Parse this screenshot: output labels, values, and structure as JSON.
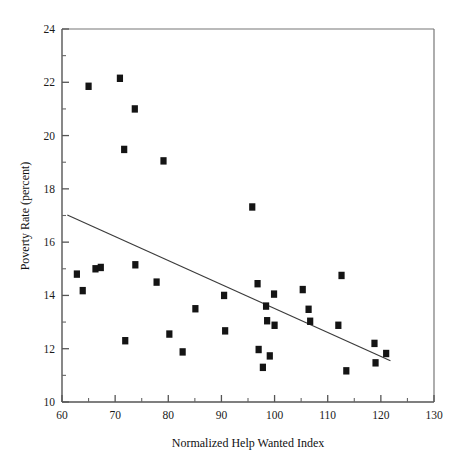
{
  "chart_data": {
    "type": "scatter",
    "title": "",
    "xlabel": "Normalized Help Wanted Index",
    "ylabel": "Poverty Rate (percent)",
    "xlim": [
      60,
      130
    ],
    "ylim": [
      10,
      24
    ],
    "x_major_ticks": [
      60,
      70,
      80,
      90,
      100,
      110,
      120,
      130
    ],
    "x_minor_ticks": [
      65,
      75,
      85,
      95,
      105,
      115,
      125
    ],
    "y_major_ticks": [
      10,
      12,
      14,
      16,
      18,
      20,
      22,
      24
    ],
    "y_minor_ticks": [
      11,
      13,
      15,
      17,
      19,
      21,
      23
    ],
    "x_tick_labels": [
      "60",
      "70",
      "80",
      "90",
      "100",
      "110",
      "120",
      "130"
    ],
    "y_tick_labels": [
      "10",
      "12",
      "14",
      "16",
      "18",
      "20",
      "22",
      "24"
    ],
    "grid": false,
    "legend": "none",
    "marker_shape": "square",
    "marker_color": "#141414",
    "points": [
      {
        "x": 62.8,
        "y": 14.8
      },
      {
        "x": 63.9,
        "y": 14.18
      },
      {
        "x": 65.0,
        "y": 21.85
      },
      {
        "x": 66.3,
        "y": 15.0
      },
      {
        "x": 67.3,
        "y": 15.05
      },
      {
        "x": 70.9,
        "y": 22.15
      },
      {
        "x": 71.7,
        "y": 19.48
      },
      {
        "x": 71.9,
        "y": 12.3
      },
      {
        "x": 73.7,
        "y": 21.0
      },
      {
        "x": 73.8,
        "y": 15.15
      },
      {
        "x": 77.8,
        "y": 14.5
      },
      {
        "x": 79.1,
        "y": 19.05
      },
      {
        "x": 80.2,
        "y": 12.55
      },
      {
        "x": 82.7,
        "y": 11.88
      },
      {
        "x": 85.1,
        "y": 13.5
      },
      {
        "x": 90.5,
        "y": 14.0
      },
      {
        "x": 90.7,
        "y": 12.67
      },
      {
        "x": 95.8,
        "y": 17.32
      },
      {
        "x": 96.8,
        "y": 14.44
      },
      {
        "x": 97.0,
        "y": 11.97
      },
      {
        "x": 97.8,
        "y": 11.3
      },
      {
        "x": 98.4,
        "y": 13.6
      },
      {
        "x": 98.6,
        "y": 13.05
      },
      {
        "x": 99.1,
        "y": 11.73
      },
      {
        "x": 99.9,
        "y": 14.05
      },
      {
        "x": 100.0,
        "y": 12.88
      },
      {
        "x": 105.3,
        "y": 14.22
      },
      {
        "x": 106.4,
        "y": 13.48
      },
      {
        "x": 106.7,
        "y": 13.03
      },
      {
        "x": 112.0,
        "y": 12.88
      },
      {
        "x": 112.6,
        "y": 14.75
      },
      {
        "x": 113.5,
        "y": 11.17
      },
      {
        "x": 118.8,
        "y": 12.2
      },
      {
        "x": 119.0,
        "y": 11.47
      },
      {
        "x": 121.0,
        "y": 11.82
      }
    ],
    "trend_line": {
      "x_start": 61.0,
      "y_start": 17.02,
      "x_end": 121.8,
      "y_end": 11.55,
      "style": "solid",
      "color": "#3b3b3b"
    }
  }
}
